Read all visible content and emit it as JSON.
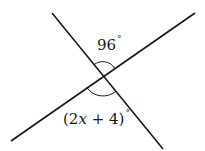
{
  "diagram": {
    "type": "intersecting-lines",
    "line_color": "#1a1a1a",
    "lines": [
      {
        "name": "line-1",
        "x1": 52,
        "y1": 13,
        "x2": 163,
        "y2": 149
      },
      {
        "name": "line-2",
        "x1": 11,
        "y1": 141,
        "x2": 195,
        "y2": 13
      }
    ],
    "intersection": {
      "x": 103,
      "y": 76
    },
    "angles": {
      "top": {
        "value": "96",
        "degree_symbol": "°"
      },
      "bottom": {
        "open": "(2",
        "var": "x",
        "rest": " + 4)",
        "degree_symbol": "°"
      }
    }
  }
}
